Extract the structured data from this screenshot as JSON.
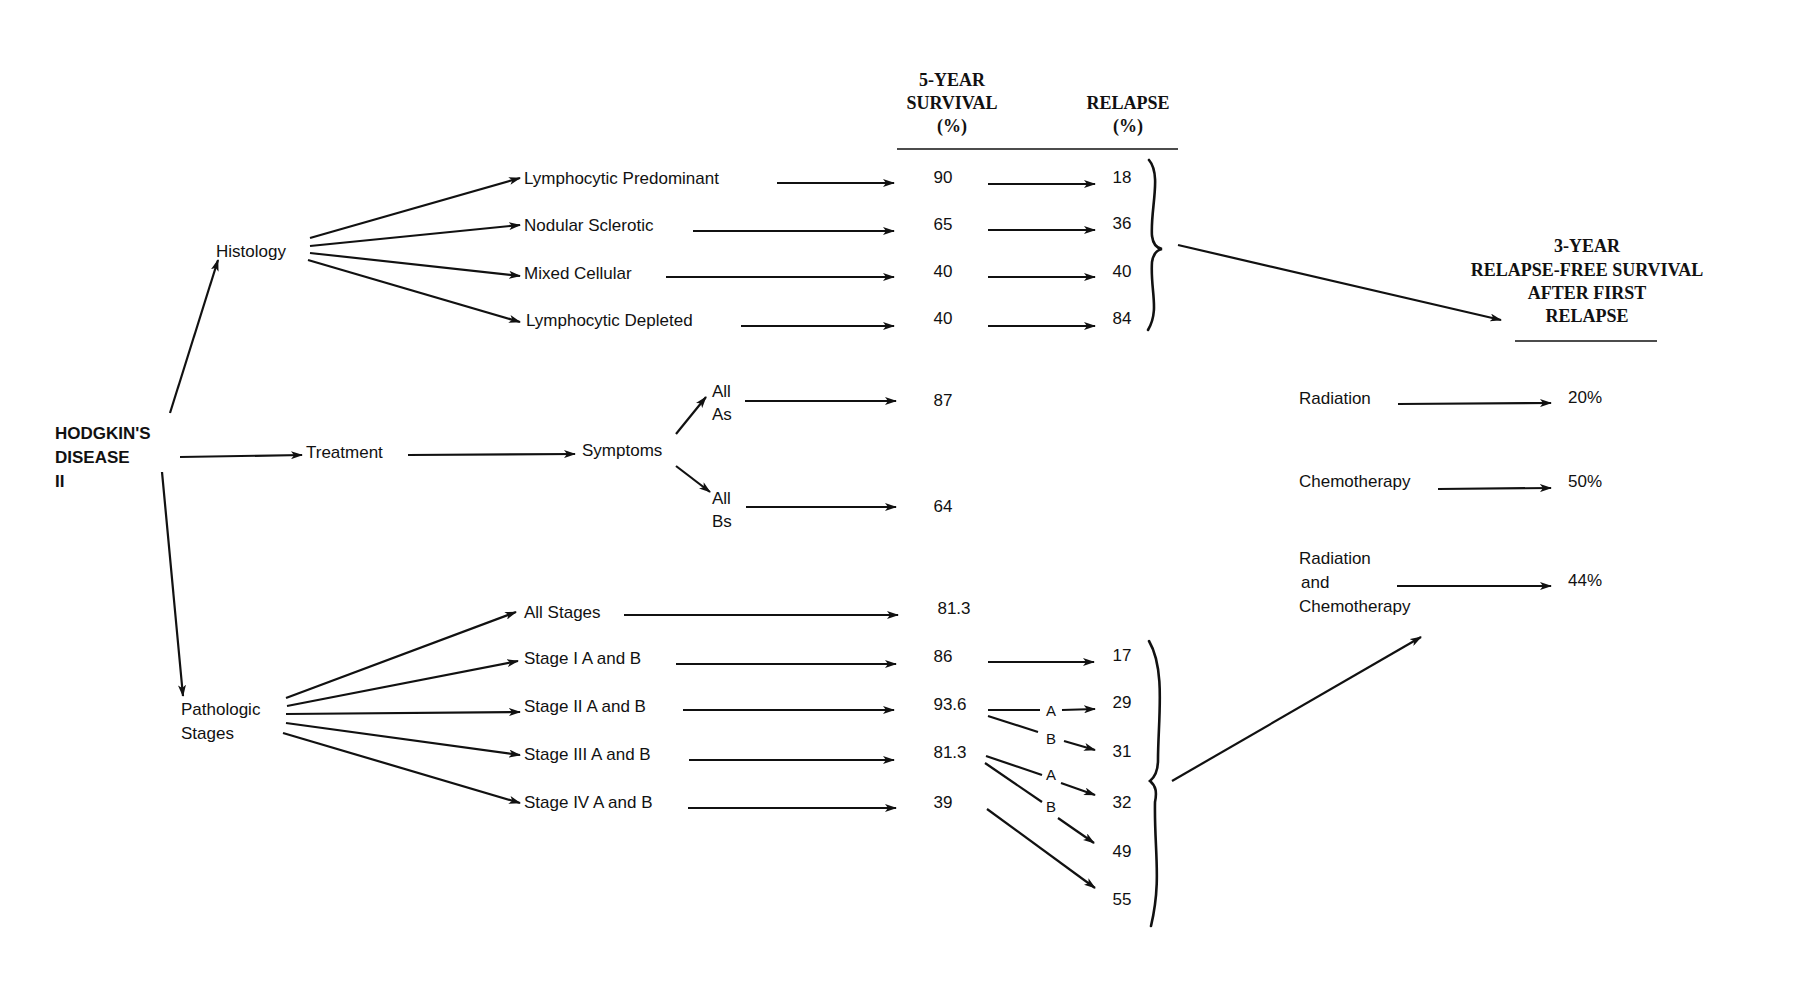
{
  "root": {
    "lines": [
      "HODGKIN'S",
      "DISEASE",
      "II"
    ]
  },
  "headers": {
    "survival": [
      "5-YEAR",
      "SURVIVAL",
      "(%)"
    ],
    "relapse": [
      "RELAPSE",
      "(%)"
    ],
    "rfs": [
      "3-YEAR",
      "RELAPSE-FREE SURVIVAL",
      "AFTER FIRST",
      "RELAPSE"
    ]
  },
  "histology": {
    "label": "Histology",
    "items": [
      {
        "label": "Lymphocytic Predominant",
        "survival": "90",
        "relapse": "18"
      },
      {
        "label": "Nodular Sclerotic",
        "survival": "65",
        "relapse": "36"
      },
      {
        "label": "Mixed Cellular",
        "survival": "40",
        "relapse": "40"
      },
      {
        "label": "Lymphocytic Depleted",
        "survival": "40",
        "relapse": "84"
      }
    ]
  },
  "treatment": {
    "label": "Treatment",
    "symptoms": {
      "label": "Symptoms",
      "items": [
        {
          "label": [
            "All",
            "As"
          ],
          "survival": "87"
        },
        {
          "label": [
            "All",
            "Bs"
          ],
          "survival": "64"
        }
      ]
    }
  },
  "stages": {
    "label": [
      "Pathologic",
      "Stages"
    ],
    "items": [
      {
        "label": "All Stages",
        "survival": "81.3"
      },
      {
        "label": "Stage I A and B",
        "survival": "86"
      },
      {
        "label": "Stage II A and B",
        "survival": "93.6"
      },
      {
        "label": "Stage III A and B",
        "survival": "81.3"
      },
      {
        "label": "Stage IV A and B",
        "survival": "39"
      }
    ],
    "relapse_values": [
      "17",
      "29",
      "31",
      "32",
      "49",
      "55"
    ],
    "branch_labels": {
      "a": "A",
      "b": "B"
    }
  },
  "rfs_outcomes": [
    {
      "label": [
        "Radiation"
      ],
      "value": "20%"
    },
    {
      "label": [
        "Chemotherapy"
      ],
      "value": "50%"
    },
    {
      "label": [
        "Radiation",
        "and",
        "Chemotherapy"
      ],
      "value": "44%"
    }
  ],
  "colors": {
    "ink": "#111111",
    "paper": "#ffffff"
  }
}
